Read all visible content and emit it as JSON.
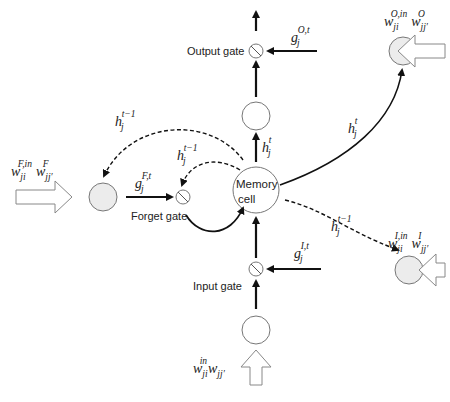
{
  "diagram": {
    "type": "LSTM memory block",
    "colors": {
      "line": "#111111",
      "node_stroke": "#7a7a7a",
      "gray_node_fill": "#ececec",
      "hollow_arrow_stroke": "#8a8a8a"
    },
    "nodes": {
      "memory_cell": {
        "label_line1": "Memory",
        "label_line2": "cell"
      },
      "output_gate": {
        "label": "Output gate"
      },
      "forget_gate": {
        "label": "Forget gate"
      },
      "input_gate": {
        "label": "Input gate"
      }
    },
    "labels": {
      "output_gate_signal": {
        "base": "g",
        "sub": "j",
        "sup": "O,t"
      },
      "forget_gate_signal": {
        "base": "g",
        "sub": "j",
        "sup": "F,t"
      },
      "input_gate_signal": {
        "base": "g",
        "sub": "j",
        "sup": "I,t"
      },
      "h_t_up": {
        "base": "h",
        "sub": "j",
        "sup": "t"
      },
      "h_t_curve": {
        "base": "h",
        "sub": "j",
        "sup": "t"
      },
      "h_prev_forget_outer": {
        "base": "h",
        "sub": "j",
        "sup": "t−1"
      },
      "h_prev_forget_inner": {
        "base": "h",
        "sub": "j",
        "sup": "t−1"
      },
      "h_prev_input": {
        "base": "h",
        "sub": "j",
        "sup": "t−1"
      },
      "w_output": {
        "w1": "w",
        "w1_sub": "ji",
        "w1_sup": "O,in",
        "w2": "w",
        "w2_sub": "jj′",
        "w2_sup": "O"
      },
      "w_forget": {
        "w1": "w",
        "w1_sub": "ji",
        "w1_sup": "F,in",
        "w2": "w",
        "w2_sub": "jj′",
        "w2_sup": "F"
      },
      "w_input_gate": {
        "w1": "w",
        "w1_sub": "ji",
        "w1_sup": "I,in",
        "w2": "w",
        "w2_sub": "jj′",
        "w2_sup": "I"
      },
      "w_input": {
        "w1": "w",
        "w1_sub": "ji",
        "w1_sup": "in",
        "w2": "w",
        "w2_sub": "jj′",
        "w2_sup": ""
      }
    }
  }
}
